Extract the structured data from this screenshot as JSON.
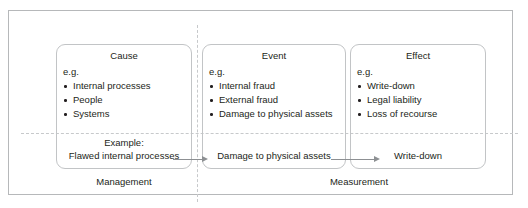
{
  "diagram": {
    "colors": {
      "frame": "#b6b8ba",
      "box_border": "#c2c4c6",
      "dashed_divider": "#c7c9cb",
      "arrow": "#8d9093",
      "text": "#231f20",
      "background": "#ffffff"
    },
    "nodes": [
      {
        "id": "cause",
        "title": "Cause",
        "eg_label": "e.g.",
        "items": [
          "Internal processes",
          "People",
          "Systems"
        ]
      },
      {
        "id": "event",
        "title": "Event",
        "eg_label": "e.g.",
        "items": [
          "Internal fraud",
          "External fraud",
          "Damage to physical assets"
        ]
      },
      {
        "id": "effect",
        "title": "Effect",
        "eg_label": "e.g.",
        "items": [
          "Write-down",
          "Legal liability",
          "Loss of recourse"
        ]
      }
    ],
    "example": {
      "caption": "Example:",
      "cause": "Flawed internal processes",
      "event": "Damage to physical assets",
      "effect": "Write-down"
    },
    "arrows": [
      {
        "id": "cause-to-event",
        "direction": "right"
      },
      {
        "id": "event-to-effect",
        "direction": "right"
      }
    ],
    "sections": [
      {
        "id": "management",
        "label": "Management"
      },
      {
        "id": "measurement",
        "label": "Measurement"
      }
    ]
  }
}
